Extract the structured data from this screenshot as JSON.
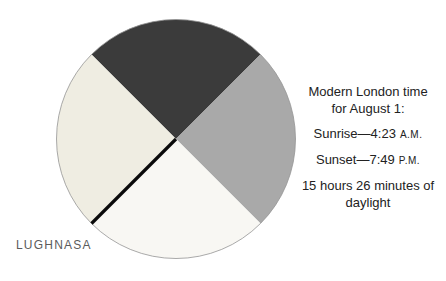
{
  "figure": {
    "label": "LUGHNASA",
    "background": "#ffffff"
  },
  "annotation": {
    "title_line1": "Modern London time",
    "title_line2": "for August 1:",
    "sunrise_text": "Sunrise—4:23",
    "sunrise_meridiem": "A.M.",
    "sunset_text": "Sunset—7:49",
    "sunset_meridiem": "P.M.",
    "daylight_line1": "15 hours 26 minutes of",
    "daylight_line2": "daylight"
  },
  "chart_data": {
    "type": "pie",
    "title": "LUGHNASA",
    "legend_position": "none",
    "segments": [
      {
        "name": "top-quadrant",
        "start_deg": 45,
        "end_deg": 135,
        "fraction": 0.25,
        "color": "#3b3b3b"
      },
      {
        "name": "right-quadrant",
        "start_deg": -45,
        "end_deg": 45,
        "fraction": 0.25,
        "color": "#a9a9a9"
      },
      {
        "name": "bottom-quadrant",
        "start_deg": 225,
        "end_deg": 315,
        "fraction": 0.25,
        "color": "#f8f7f3"
      },
      {
        "name": "left-quadrant",
        "start_deg": 135,
        "end_deg": 225,
        "fraction": 0.25,
        "color": "#efede2"
      }
    ],
    "divider_line": {
      "angle_deg": 225,
      "color": "#0a0a0a",
      "width": 3.2
    },
    "outline_color": "#949494",
    "annotations": [
      "Modern London time for August 1:",
      "Sunrise—4:23 A.M.",
      "Sunset—7:49 P.M.",
      "15 hours 26 minutes of daylight"
    ]
  }
}
